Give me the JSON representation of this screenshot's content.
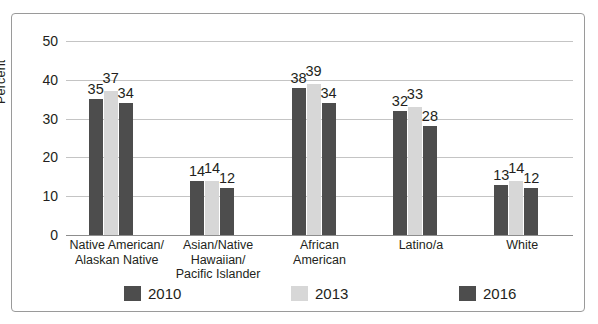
{
  "chart_data": {
    "type": "bar",
    "title": "",
    "xlabel": "",
    "ylabel": "Percent",
    "ylim": [
      0,
      50
    ],
    "ytick_values": [
      0,
      10,
      20,
      30,
      40,
      50
    ],
    "ytick_labels": [
      "0",
      "10",
      "20",
      "30",
      "40",
      "50"
    ],
    "grid": true,
    "legend_position": "bottom",
    "categories": [
      "Native American/\nAlaskan Native",
      "Asian/Native\nHawaiian/\nPacific Islander",
      "African\nAmerican",
      "Latino/a",
      "White"
    ],
    "category_lines": [
      [
        "Native American/",
        "Alaskan Native"
      ],
      [
        "Asian/Native",
        "Hawaiian/",
        "Pacific Islander"
      ],
      [
        "African",
        "American"
      ],
      [
        "Latino/a"
      ],
      [
        "White"
      ]
    ],
    "series": [
      {
        "name": "2010",
        "color": "#4d4d4d",
        "values": [
          35,
          14,
          38,
          32,
          13
        ]
      },
      {
        "name": "2013",
        "color": "#d7d7d7",
        "values": [
          37,
          14,
          39,
          33,
          14
        ]
      },
      {
        "name": "2016",
        "color": "#4d4d4d",
        "values": [
          34,
          12,
          34,
          28,
          12
        ]
      }
    ],
    "data_labels": [
      [
        "35",
        "37",
        "34"
      ],
      [
        "14",
        "14",
        "12"
      ],
      [
        "38",
        "39",
        "34"
      ],
      [
        "32",
        "33",
        "28"
      ],
      [
        "13",
        "14",
        "12"
      ]
    ]
  },
  "legend": {
    "items": [
      {
        "label": "2010",
        "color": "#4d4d4d"
      },
      {
        "label": "2013",
        "color": "#d7d7d7"
      },
      {
        "label": "2016",
        "color": "#4d4d4d"
      }
    ]
  }
}
